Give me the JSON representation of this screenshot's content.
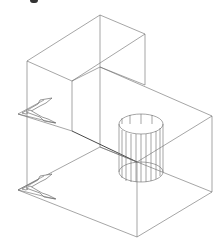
{
  "figure": {
    "stroke_color": "#6a6a6a"
  },
  "geometry": {
    "upper_box": {
      "top": [
        100,
        15
      ],
      "left": [
        27,
        61
      ],
      "right": [
        145,
        34
      ],
      "front": [
        72,
        81
      ]
    },
    "lower_box": {
      "top": [
        100,
        67
      ],
      "left": [
        18,
        114
      ],
      "right": [
        212,
        116
      ],
      "front": [
        137,
        162
      ],
      "bottom_front": [
        137,
        237
      ],
      "bottom_left": [
        18,
        190
      ],
      "bottom_right": [
        212,
        192
      ]
    },
    "cylinder": {
      "cx": 141,
      "top_y": 124,
      "bottom_y": 172,
      "rx": 22,
      "ry": 10
    }
  }
}
